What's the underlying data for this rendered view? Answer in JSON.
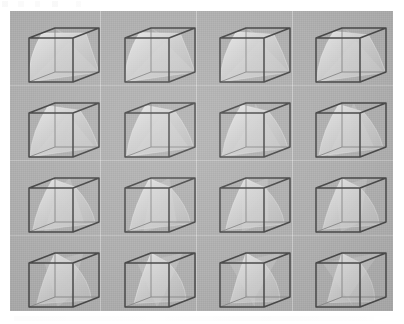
{
  "figure": {
    "type": "image-grid",
    "caption": "",
    "background_color": "#b0b0b0",
    "page_color": "#ffffff",
    "panel": {
      "x": 10,
      "y": 11,
      "width": 383,
      "height": 300
    },
    "grid": {
      "rows": 4,
      "columns": 4,
      "count": 16
    },
    "cube": {
      "edge_color": "#4a4a4a",
      "hidden_edge_color": "#8e8e8e",
      "surface_color": "#d8d8d8",
      "surface_opacity": 0.55,
      "projection": "oblique-isometric"
    },
    "separators": {
      "vertical_x": [
        100,
        196,
        292
      ],
      "horizontal_y": [
        85,
        160,
        235
      ],
      "color": "#ffffff"
    },
    "items": [
      {
        "index": 1,
        "row": 1,
        "col": 1,
        "label": "",
        "twist": 0.0,
        "sheet": "saddle",
        "variant": "a"
      },
      {
        "index": 2,
        "row": 1,
        "col": 2,
        "label": "",
        "twist": 0.12,
        "sheet": "saddle",
        "variant": "b"
      },
      {
        "index": 3,
        "row": 1,
        "col": 3,
        "label": "",
        "twist": 0.24,
        "sheet": "saddle",
        "variant": "c"
      },
      {
        "index": 4,
        "row": 1,
        "col": 4,
        "label": "",
        "twist": 0.36,
        "sheet": "saddle",
        "variant": "d"
      },
      {
        "index": 5,
        "row": 2,
        "col": 1,
        "label": "",
        "twist": 0.48,
        "sheet": "saddle",
        "variant": "e"
      },
      {
        "index": 6,
        "row": 2,
        "col": 2,
        "label": "",
        "twist": 0.6,
        "sheet": "saddle",
        "variant": "f"
      },
      {
        "index": 7,
        "row": 2,
        "col": 3,
        "label": "",
        "twist": 0.72,
        "sheet": "saddle",
        "variant": "g"
      },
      {
        "index": 8,
        "row": 2,
        "col": 4,
        "label": "",
        "twist": 0.84,
        "sheet": "saddle",
        "variant": "h"
      },
      {
        "index": 9,
        "row": 3,
        "col": 1,
        "label": "",
        "twist": 0.96,
        "sheet": "saddle",
        "variant": "i"
      },
      {
        "index": 10,
        "row": 3,
        "col": 2,
        "label": "",
        "twist": 1.08,
        "sheet": "saddle",
        "variant": "j"
      },
      {
        "index": 11,
        "row": 3,
        "col": 3,
        "label": "",
        "twist": 1.2,
        "sheet": "saddle",
        "variant": "k"
      },
      {
        "index": 12,
        "row": 3,
        "col": 4,
        "label": "",
        "twist": 1.32,
        "sheet": "saddle",
        "variant": "l"
      },
      {
        "index": 13,
        "row": 4,
        "col": 1,
        "label": "",
        "twist": 1.44,
        "sheet": "saddle",
        "variant": "m"
      },
      {
        "index": 14,
        "row": 4,
        "col": 2,
        "label": "",
        "twist": 1.56,
        "sheet": "saddle",
        "variant": "n"
      },
      {
        "index": 15,
        "row": 4,
        "col": 3,
        "label": "",
        "twist": 1.68,
        "sheet": "saddle",
        "variant": "o"
      },
      {
        "index": 16,
        "row": 4,
        "col": 4,
        "label": "",
        "twist": 1.8,
        "sheet": "saddle",
        "variant": "p"
      }
    ]
  }
}
